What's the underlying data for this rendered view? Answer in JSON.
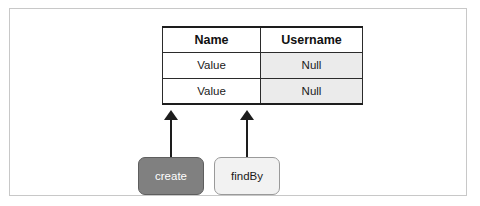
{
  "figure": {
    "caption_remnant": "",
    "frame_color": "#c8c8c8",
    "background": "#ffffff"
  },
  "table": {
    "name": "entity-table",
    "columns": [
      "Name",
      "Username"
    ],
    "rows": [
      {
        "name": "Value",
        "username": "Null"
      },
      {
        "name": "Value",
        "username": "Null"
      }
    ],
    "header_background": "#ffffff",
    "name_cell_background": "#ffffff",
    "username_cell_background": "#ebebeb",
    "border_color": "#2b2b2b"
  },
  "methods": [
    {
      "label": "create",
      "fill": "#808080",
      "text_color": "#ffffff",
      "border_color": "#5e5e5e",
      "target_column": "Name"
    },
    {
      "label": "findBy",
      "fill": "#f2f2f2",
      "text_color": "#1a1a1a",
      "border_color": "#9a9a9a",
      "target_column": "Username"
    }
  ],
  "arrows": [
    {
      "from": "create",
      "to": "table",
      "direction": "up",
      "color": "#1d1d1d"
    },
    {
      "from": "findBy",
      "to": "table",
      "direction": "up",
      "color": "#1d1d1d"
    }
  ],
  "chart_data": {
    "type": "table",
    "title": "",
    "columns": [
      "Name",
      "Username"
    ],
    "rows": [
      [
        "Value",
        "Null"
      ],
      [
        "Value",
        "Null"
      ]
    ],
    "annotations": [
      "create",
      "findBy"
    ]
  }
}
